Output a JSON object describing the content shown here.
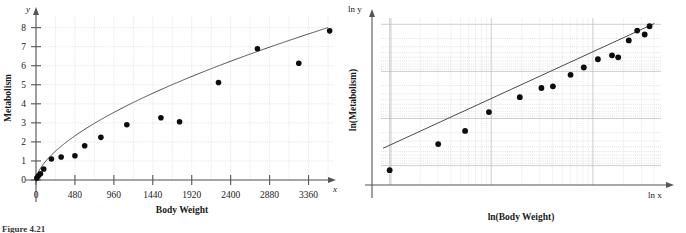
{
  "figure": {
    "caption": "Figure 4.21"
  },
  "panels": [
    {
      "id": "left",
      "y_axis_var": "y",
      "x_axis_var": "x",
      "x_title": "Body Weight",
      "y_title": "Metabolism",
      "x_ticklabels": [
        "0",
        "480",
        "960",
        "1440",
        "1920",
        "2400",
        "2880",
        "3360"
      ],
      "y_ticklabels": [
        "0",
        "1",
        "2",
        "3",
        "4",
        "5",
        "6",
        "7",
        "8"
      ]
    },
    {
      "id": "right",
      "y_axis_var": "ln y",
      "x_axis_var": "ln x",
      "x_title": "ln(Body Weight)",
      "y_title": "ln(Metabolism)",
      "x_ticklabels": [],
      "y_ticklabels": []
    }
  ],
  "chart_data": [
    {
      "type": "scatter",
      "title": "",
      "xlabel": "Body Weight",
      "ylabel": "Metabolism",
      "xvar": "x",
      "yvar": "y",
      "xlim": [
        -240,
        3840
      ],
      "ylim": [
        -0.7,
        8.6
      ],
      "xticks": [
        0,
        480,
        960,
        1440,
        1920,
        2400,
        2880,
        3360
      ],
      "yticks": [
        0,
        1,
        2,
        3,
        4,
        5,
        6,
        7,
        8
      ],
      "grid": true,
      "grid_spacing_x": 240,
      "grid_spacing_y": 1,
      "legend": "none",
      "points": [
        {
          "x": 10,
          "y": 0.1
        },
        {
          "x": 30,
          "y": 0.22
        },
        {
          "x": 55,
          "y": 0.33
        },
        {
          "x": 95,
          "y": 0.58
        },
        {
          "x": 190,
          "y": 1.1
        },
        {
          "x": 310,
          "y": 1.21
        },
        {
          "x": 480,
          "y": 1.27
        },
        {
          "x": 600,
          "y": 1.8
        },
        {
          "x": 800,
          "y": 2.24
        },
        {
          "x": 1120,
          "y": 2.9
        },
        {
          "x": 1540,
          "y": 3.27
        },
        {
          "x": 1770,
          "y": 3.06
        },
        {
          "x": 2250,
          "y": 5.12
        },
        {
          "x": 2730,
          "y": 6.89
        },
        {
          "x": 3240,
          "y": 6.13
        },
        {
          "x": 3620,
          "y": 7.83
        }
      ],
      "fit_curve": {
        "form": "power",
        "description": "y = a*x^b fitted power curve through scatter",
        "a": 0.052,
        "b": 0.615
      }
    },
    {
      "type": "scatter",
      "title": "",
      "xlabel": "ln(Body Weight)",
      "ylabel": "ln(Metabolism)",
      "xvar": "ln x",
      "yvar": "ln y",
      "xlim": [
        1.8,
        8.5
      ],
      "ylim": [
        -2.5,
        2.3
      ],
      "xticks": [],
      "yticks": [],
      "grid": true,
      "grid_type": "logarithmic",
      "legend": "none",
      "points": [
        {
          "x": 2.3,
          "y": -2.3
        },
        {
          "x": 3.4,
          "y": -1.51
        },
        {
          "x": 4.01,
          "y": -1.11
        },
        {
          "x": 4.55,
          "y": -0.54
        },
        {
          "x": 5.25,
          "y": -0.09
        },
        {
          "x": 5.74,
          "y": 0.19
        },
        {
          "x": 6.0,
          "y": 0.24
        },
        {
          "x": 6.4,
          "y": 0.59
        },
        {
          "x": 6.7,
          "y": 0.81
        },
        {
          "x": 7.02,
          "y": 1.06
        },
        {
          "x": 7.34,
          "y": 1.18
        },
        {
          "x": 7.48,
          "y": 1.12
        },
        {
          "x": 7.72,
          "y": 1.63
        },
        {
          "x": 7.91,
          "y": 1.93
        },
        {
          "x": 8.08,
          "y": 1.81
        },
        {
          "x": 8.19,
          "y": 2.06
        }
      ],
      "fit_line": {
        "form": "linear",
        "description": "least squares line ln y = m*ln x + c",
        "slope": 0.615,
        "intercept": -2.96
      }
    }
  ]
}
